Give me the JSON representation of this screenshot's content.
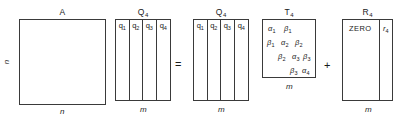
{
  "figure": {
    "equation_operators": {
      "equals": "=",
      "plus": "+"
    }
  },
  "blocks": [
    {
      "id": "A",
      "name": "matrix-a",
      "label": "A",
      "label_sub": "",
      "dim_left": "n",
      "dim_bottom": "n",
      "shape": "square"
    },
    {
      "id": "Q4-left",
      "name": "matrix-q4-left",
      "label": "Q",
      "label_sub": "4",
      "dim_bottom": "m",
      "columns": [
        {
          "label": "q",
          "sub": "1"
        },
        {
          "label": "q",
          "sub": "2"
        },
        {
          "label": "q",
          "sub": "3"
        },
        {
          "label": "q",
          "sub": "4"
        }
      ]
    },
    {
      "id": "Q4-right",
      "name": "matrix-q4-right",
      "label": "Q",
      "label_sub": "4",
      "dim_bottom": "m",
      "columns": [
        {
          "label": "q",
          "sub": "1"
        },
        {
          "label": "q",
          "sub": "2"
        },
        {
          "label": "q",
          "sub": "3"
        },
        {
          "label": "q",
          "sub": "4"
        }
      ]
    },
    {
      "id": "T4",
      "name": "matrix-t4",
      "label": "T",
      "label_sub": "4",
      "dim_bottom": "m",
      "rows": [
        [
          {
            "sym": "α",
            "sub": "1"
          },
          {
            "sym": "β",
            "sub": "1"
          }
        ],
        [
          {
            "sym": "β",
            "sub": "1"
          },
          {
            "sym": "α",
            "sub": "2"
          },
          {
            "sym": "β",
            "sub": "2"
          }
        ],
        [
          {
            "sym": "β",
            "sub": "2"
          },
          {
            "sym": "α",
            "sub": "3"
          },
          {
            "sym": "β",
            "sub": "3"
          }
        ],
        [
          {
            "sym": "β",
            "sub": "3"
          },
          {
            "sym": "α",
            "sub": "4"
          }
        ]
      ]
    },
    {
      "id": "R4",
      "name": "matrix-r4",
      "label": "R",
      "label_sub": "4",
      "dim_bottom": "m",
      "zero_text": "ZERO",
      "last_column": {
        "label": "r",
        "sub": "4"
      }
    }
  ],
  "t4_entries": {
    "r0c0": {
      "sym": "α",
      "sub": "1"
    },
    "r0c1": {
      "sym": "β",
      "sub": "1"
    },
    "r1c0": {
      "sym": "β",
      "sub": "1"
    },
    "r1c1": {
      "sym": "α",
      "sub": "2"
    },
    "r1c2": {
      "sym": "β",
      "sub": "2"
    },
    "r2c1": {
      "sym": "β",
      "sub": "2"
    },
    "r2c2": {
      "sym": "α",
      "sub": "3"
    },
    "r2c3": {
      "sym": "β",
      "sub": "3"
    },
    "r3c2": {
      "sym": "β",
      "sub": "3"
    },
    "r3c3": {
      "sym": "α",
      "sub": "4"
    }
  },
  "colors": {
    "line": "#3a3a3a",
    "text": "#1a1a1a",
    "background": "#ffffff"
  }
}
